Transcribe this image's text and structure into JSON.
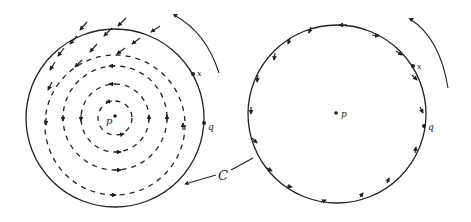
{
  "diagram": {
    "left_panel": {
      "point_p": "p",
      "point_x": "x",
      "point_q": "q"
    },
    "right_panel": {
      "point_p": "p",
      "point_x": "x",
      "point_q": "q"
    },
    "curve_label": "C",
    "colors": {
      "ink": "#222222",
      "background": "#ffffff"
    }
  }
}
